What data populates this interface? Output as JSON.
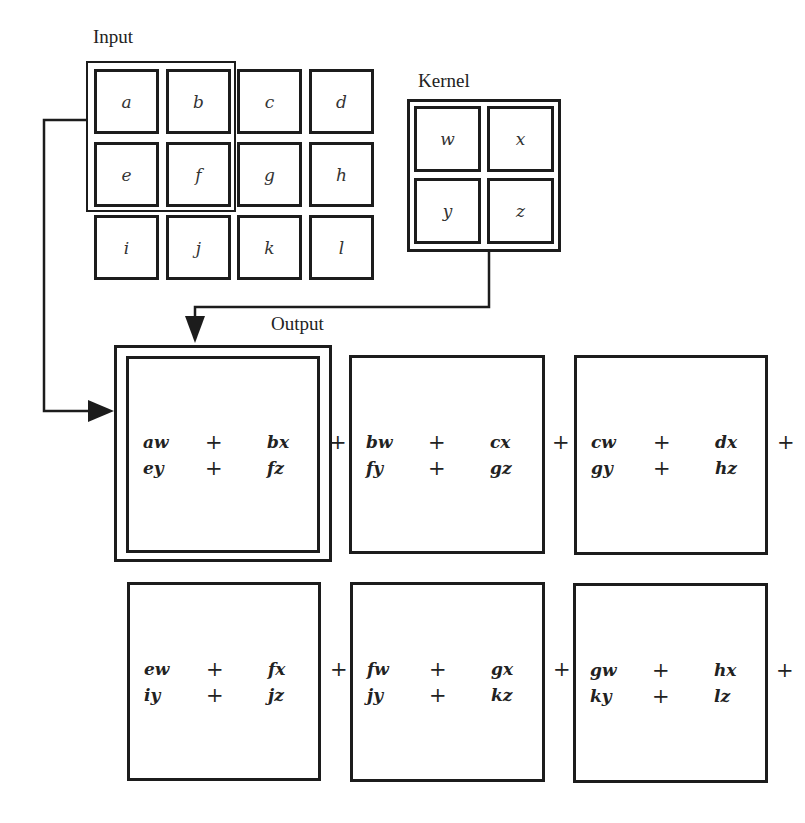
{
  "labels": {
    "input": "Input",
    "kernel": "Kernel",
    "output": "Output"
  },
  "input": {
    "rows": [
      [
        "a",
        "b",
        "c",
        "d"
      ],
      [
        "e",
        "f",
        "g",
        "h"
      ],
      [
        "i",
        "j",
        "k",
        "l"
      ]
    ],
    "highlighted_window": [
      "a",
      "b",
      "e",
      "f"
    ]
  },
  "kernel": {
    "rows": [
      [
        "w",
        "x"
      ],
      [
        "y",
        "z"
      ]
    ]
  },
  "output": {
    "cells": [
      {
        "line1": [
          "aw",
          "+",
          "bx",
          "+"
        ],
        "line2": [
          "ey",
          "+",
          "fz"
        ]
      },
      {
        "line1": [
          "bw",
          "+",
          "cx",
          "+"
        ],
        "line2": [
          "fy",
          "+",
          "gz"
        ]
      },
      {
        "line1": [
          "cw",
          "+",
          "dx",
          "+"
        ],
        "line2": [
          "gy",
          "+",
          "hz"
        ]
      },
      {
        "line1": [
          "ew",
          "+",
          "fx",
          "+"
        ],
        "line2": [
          "iy",
          "+",
          "jz"
        ]
      },
      {
        "line1": [
          "fw",
          "+",
          "gx",
          "+"
        ],
        "line2": [
          "jy",
          "+",
          "kz"
        ]
      },
      {
        "line1": [
          "gw",
          "+",
          "hx",
          "+"
        ],
        "line2": [
          "ky",
          "+",
          "lz"
        ]
      }
    ],
    "highlighted_cell": 0
  },
  "colors": {
    "stroke": "#1c1c1c",
    "background": "#ffffff"
  }
}
